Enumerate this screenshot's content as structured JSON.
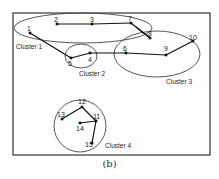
{
  "caption": "(b)",
  "frame": {
    "x": 13,
    "y": 13,
    "w": 197,
    "h": 142
  },
  "nodes": [
    {
      "id": "1",
      "x": 30,
      "y": 33,
      "lx": 27,
      "ly": 31
    },
    {
      "id": "2",
      "x": 57,
      "y": 24,
      "lx": 54,
      "ly": 22
    },
    {
      "id": "3",
      "x": 92,
      "y": 24,
      "lx": 90,
      "ly": 22
    },
    {
      "id": "4",
      "x": 90,
      "y": 53,
      "lx": 88,
      "ly": 62
    },
    {
      "id": "5",
      "x": 71,
      "y": 58,
      "lx": 68,
      "ly": 66
    },
    {
      "id": "6",
      "x": 126,
      "y": 53,
      "lx": 123,
      "ly": 51
    },
    {
      "id": "7",
      "x": 131,
      "y": 23,
      "lx": 128,
      "ly": 21
    },
    {
      "id": "8",
      "x": 150,
      "y": 38,
      "lx": 148,
      "ly": 36
    },
    {
      "id": "9",
      "x": 166,
      "y": 55,
      "lx": 164,
      "ly": 51
    },
    {
      "id": "10",
      "x": 193,
      "y": 41,
      "lx": 189,
      "ly": 40
    },
    {
      "id": "11",
      "x": 96,
      "y": 121,
      "lx": 93,
      "ly": 119
    },
    {
      "id": "12",
      "x": 82,
      "y": 107,
      "lx": 78,
      "ly": 104
    },
    {
      "id": "13",
      "x": 62,
      "y": 119,
      "lx": 57,
      "ly": 117
    },
    {
      "id": "14",
      "x": 80,
      "y": 123,
      "lx": 76,
      "ly": 131
    },
    {
      "id": "15",
      "x": 92,
      "y": 143,
      "lx": 85,
      "ly": 147
    }
  ],
  "edges": [
    [
      "1",
      "5"
    ],
    [
      "5",
      "4"
    ],
    [
      "4",
      "6"
    ],
    [
      "6",
      "9"
    ],
    [
      "9",
      "10"
    ],
    [
      "2",
      "3"
    ],
    [
      "3",
      "7"
    ],
    [
      "7",
      "8"
    ],
    [
      "8",
      "7b"
    ],
    [
      "13",
      "12"
    ],
    [
      "12",
      "11"
    ],
    [
      "11",
      "14"
    ],
    [
      "11",
      "15"
    ]
  ],
  "clusters": [
    {
      "label": "Cluster 1",
      "cx": 83,
      "cy": 28,
      "rx": 69,
      "ry": 15,
      "lx": 16,
      "ly": 49
    },
    {
      "label": "Cluster 2",
      "cx": 81,
      "cy": 56,
      "rx": 16,
      "ry": 12,
      "lx": 79,
      "ly": 76
    },
    {
      "label": "Cluster 3",
      "cx": 157,
      "cy": 54,
      "rx": 43,
      "ry": 23,
      "lx": 166,
      "ly": 84
    },
    {
      "label": "Cluster 4",
      "cx": 80,
      "cy": 126,
      "rx": 26,
      "ry": 26,
      "lx": 105,
      "ly": 148
    }
  ]
}
